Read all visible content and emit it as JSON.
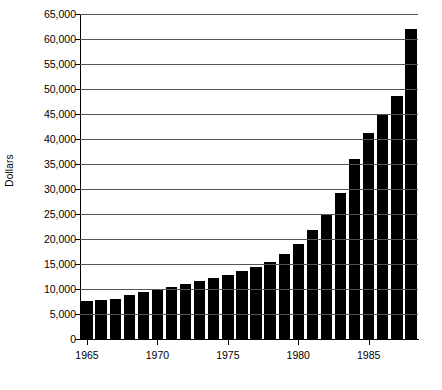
{
  "chart_data": {
    "type": "bar",
    "title": "",
    "xlabel": "",
    "ylabel": "Dollars",
    "ylim": [
      0,
      65000
    ],
    "ytick_step": 5000,
    "grid": true,
    "legend": false,
    "bar_color": "#000000",
    "axis_color": "#000000",
    "grid_color": "#555555",
    "background": "#ffffff",
    "xtick_labels": [
      "1965",
      "1970",
      "1975",
      "1980",
      "1985"
    ],
    "xtick_years": [
      1965,
      1970,
      1975,
      1980,
      1985
    ],
    "ytick_labels": [
      "0",
      "5,000",
      "10,000",
      "15,000",
      "20,000",
      "25,000",
      "30,000",
      "35,000",
      "40,000",
      "45,000",
      "50,000",
      "55,000",
      "60,000",
      "65,000"
    ],
    "ytick_values": [
      0,
      5000,
      10000,
      15000,
      20000,
      25000,
      30000,
      35000,
      40000,
      45000,
      50000,
      55000,
      60000,
      65000
    ],
    "categories": [
      "1965",
      "1966",
      "1967",
      "1968",
      "1969",
      "1970",
      "1971",
      "1972",
      "1973",
      "1974",
      "1975",
      "1976",
      "1977",
      "1978",
      "1979",
      "1980",
      "1981",
      "1982",
      "1983",
      "1984",
      "1985",
      "1986",
      "1987",
      "1988"
    ],
    "values": [
      7600,
      7800,
      8100,
      8900,
      9400,
      9900,
      10400,
      11000,
      11600,
      12200,
      12800,
      13600,
      14400,
      15400,
      17000,
      19000,
      21800,
      24800,
      29300,
      36100,
      41200,
      45000,
      48700,
      62000
    ]
  }
}
